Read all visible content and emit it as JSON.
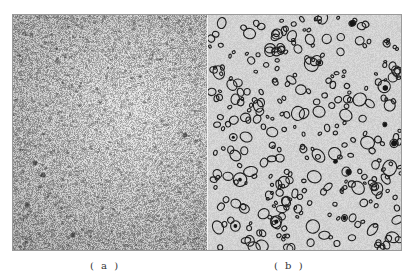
{
  "figure": {
    "panels": [
      {
        "label": "( a )",
        "description": "fine-grained mottled microstructure, lighter center",
        "texture": {
          "type": "mottled",
          "base_color": "#cfcfcf",
          "dark_color": "#3a3a3a",
          "density": 0.55,
          "seed": 7
        }
      },
      {
        "label": "( b )",
        "description": "light matrix with dispersed dark-outlined rounded particles",
        "texture": {
          "type": "particles",
          "base_color": "#d9d9d9",
          "outline_color": "#1e1e1e",
          "count": 330,
          "seed": 13
        }
      }
    ]
  }
}
